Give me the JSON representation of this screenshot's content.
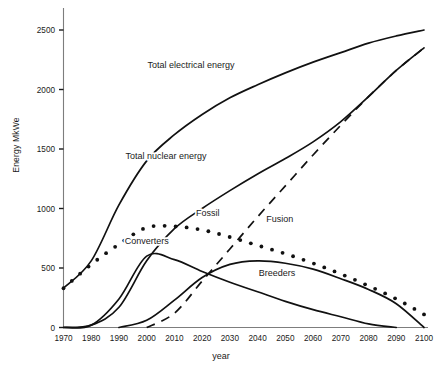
{
  "chart_data": {
    "type": "line",
    "title": "",
    "xlabel": "year",
    "ylabel": "Energy MkWe",
    "xlim": [
      1970,
      2100
    ],
    "ylim": [
      0,
      2500
    ],
    "grid": false,
    "legend_position": "inline-annotations",
    "xticks": [
      "1970",
      "1980",
      "1990",
      "2000",
      "2010",
      "2020",
      "2030",
      "2040",
      "2050",
      "2060",
      "2070",
      "2080",
      "2090",
      "2100"
    ],
    "yticks": [
      "0",
      "500",
      "1000",
      "1500",
      "2000",
      "2500"
    ],
    "x": [
      1970,
      1980,
      1990,
      2000,
      2010,
      2020,
      2030,
      2040,
      2050,
      2060,
      2070,
      2080,
      2090,
      2100
    ],
    "series": [
      {
        "name": "Total electrical energy",
        "style": "solid",
        "values": [
          330,
          560,
          1030,
          1400,
          1620,
          1790,
          1930,
          2040,
          2140,
          2230,
          2310,
          2390,
          2450,
          2500
        ]
      },
      {
        "name": "Total nuclear energy",
        "style": "solid",
        "values": [
          0,
          20,
          170,
          560,
          830,
          1000,
          1150,
          1290,
          1420,
          1560,
          1730,
          1940,
          2160,
          2350
        ]
      },
      {
        "name": "Fossil",
        "style": "dotted",
        "values": [
          330,
          530,
          700,
          840,
          850,
          820,
          760,
          690,
          620,
          540,
          450,
          350,
          240,
          110
        ]
      },
      {
        "name": "Converters",
        "style": "solid",
        "values": [
          0,
          20,
          240,
          600,
          570,
          470,
          380,
          300,
          220,
          150,
          90,
          30,
          0,
          0
        ]
      },
      {
        "name": "Breeders",
        "style": "solid",
        "values": [
          0,
          0,
          0,
          60,
          230,
          420,
          530,
          560,
          540,
          490,
          410,
          320,
          200,
          0
        ]
      },
      {
        "name": "Fusion",
        "style": "dashed",
        "values": [
          0,
          0,
          0,
          0,
          120,
          390,
          660,
          930,
          1190,
          1450,
          1700,
          1940,
          2160,
          2350
        ]
      }
    ],
    "annotations": [
      {
        "label": "Total electrical energy",
        "x": 2016,
        "y": 2180
      },
      {
        "label": "Total nuclear energy",
        "x": 2007,
        "y": 1420
      },
      {
        "label": "Fossil",
        "x": 2022,
        "y": 940
      },
      {
        "label": "Converters",
        "x": 2000,
        "y": 700
      },
      {
        "label": "Fusion",
        "x": 2048,
        "y": 890
      },
      {
        "label": "Breeders",
        "x": 2047,
        "y": 430
      }
    ]
  },
  "caption": {
    "text": ""
  }
}
